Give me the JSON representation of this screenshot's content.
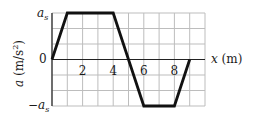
{
  "chart_data": {
    "type": "line",
    "title": "",
    "xlabel": "x (m)",
    "ylabel": "a (m/s²)",
    "x": [
      0,
      1,
      4,
      5,
      6,
      8,
      9
    ],
    "series": [
      {
        "name": "a(x)",
        "values_in_units_of_as": [
          0,
          1,
          1,
          0,
          -1,
          -1,
          0
        ]
      }
    ],
    "xlim": [
      0,
      10
    ],
    "ylim_labels": [
      "-a_s",
      "0",
      "a_s"
    ],
    "ylim": [
      -1,
      1
    ],
    "x_tick_labels": [
      "2",
      "4",
      "6",
      "8"
    ],
    "x_ticks": [
      2,
      4,
      6,
      8
    ],
    "y_tick_labels": [
      "a_s",
      "0",
      "-a_s"
    ],
    "grid": true,
    "grid_x_step": 1,
    "grid_y_step": 0.3333,
    "legend": null
  },
  "labels": {
    "y_top": "a",
    "y_top_sub": "s",
    "y_zero": "0",
    "y_bottom": "−a",
    "y_bottom_sub": "s",
    "y_axis_title": "a (m/s",
    "y_axis_sup": "2",
    "y_axis_close": ")",
    "x_axis_title": "x (m)",
    "x_ticks": [
      "2",
      "4",
      "6",
      "8"
    ]
  },
  "colors": {
    "curve": "#111111",
    "grid": "#bdbdbd",
    "axis": "#222222"
  }
}
